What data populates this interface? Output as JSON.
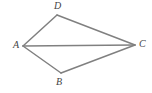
{
  "figure": {
    "background_color": "#ffffff",
    "stroke_color": "#808080",
    "label_color": "#444444",
    "stroke_width": 1.5,
    "width": 152,
    "height": 93,
    "vertices": [
      {
        "id": "A",
        "label": "A",
        "x": 23,
        "y": 46
      },
      {
        "id": "B",
        "label": "B",
        "x": 61,
        "y": 73
      },
      {
        "id": "C",
        "label": "C",
        "x": 135,
        "y": 45
      },
      {
        "id": "D",
        "label": "D",
        "x": 57,
        "y": 15
      }
    ],
    "edges": [
      {
        "id": "AD",
        "from": "A",
        "to": "D"
      },
      {
        "id": "DC",
        "from": "D",
        "to": "C"
      },
      {
        "id": "AB",
        "from": "A",
        "to": "B"
      },
      {
        "id": "BC",
        "from": "B",
        "to": "C"
      },
      {
        "id": "AC",
        "from": "A",
        "to": "C",
        "note": "diagonal"
      }
    ]
  }
}
